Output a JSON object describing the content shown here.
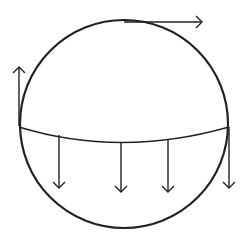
{
  "diagram": {
    "stroke_color": "#222222",
    "background": "#ffffff",
    "circle": {
      "cx": 124,
      "cy": 124,
      "r": 104
    },
    "chord": {
      "path": "M19,127 Q120,158 229,127"
    },
    "arrows": [
      {
        "id": "top-right",
        "x1": 124,
        "y1": 22,
        "x2": 202,
        "y2": 22,
        "dir": "right"
      },
      {
        "id": "left-up",
        "x1": 19,
        "y1": 126,
        "x2": 19,
        "y2": 67,
        "dir": "up"
      },
      {
        "id": "down-1",
        "x1": 59,
        "y1": 135,
        "x2": 59,
        "y2": 188,
        "dir": "down"
      },
      {
        "id": "down-2",
        "x1": 121,
        "y1": 142,
        "x2": 121,
        "y2": 192,
        "dir": "down"
      },
      {
        "id": "down-3",
        "x1": 168,
        "y1": 139,
        "x2": 168,
        "y2": 192,
        "dir": "down"
      },
      {
        "id": "down-right-edge",
        "x1": 229,
        "y1": 127,
        "x2": 229,
        "y2": 188,
        "dir": "down"
      }
    ]
  }
}
